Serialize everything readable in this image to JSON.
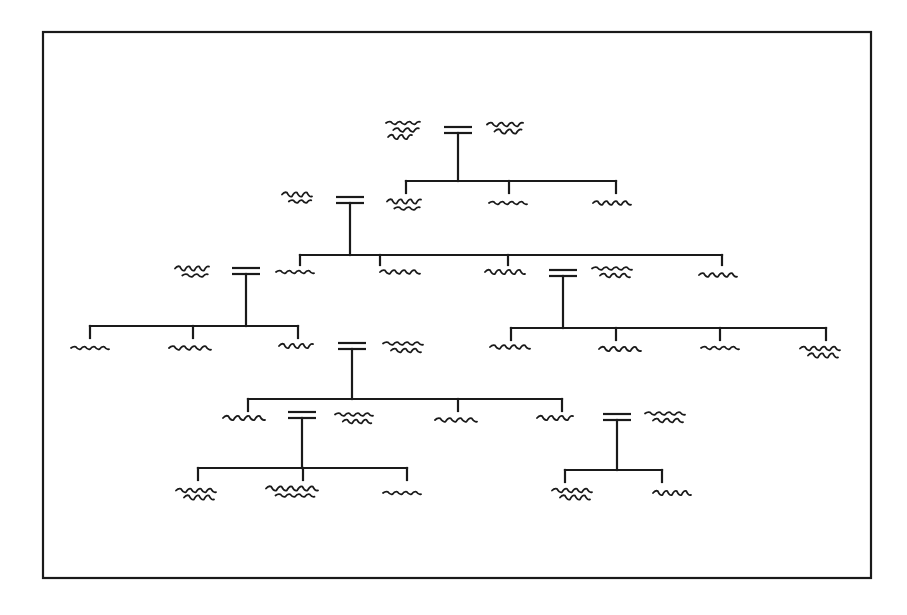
{
  "colors": {
    "ink": "#1a1a1a",
    "background": "#ffffff"
  },
  "frame": {
    "x": 43,
    "y": 32,
    "width": 828,
    "height": 546
  },
  "persons": [
    {
      "id": "p1",
      "label": "illegible name",
      "x": 403,
      "y": 130,
      "w": 34,
      "lines": 3
    },
    {
      "id": "p2",
      "label": "illegible name",
      "x": 505,
      "y": 128,
      "w": 36,
      "lines": 2
    },
    {
      "id": "p3",
      "label": "illegible name",
      "x": 404,
      "y": 205,
      "w": 34,
      "lines": 2
    },
    {
      "id": "p4",
      "label": "illegible name",
      "x": 508,
      "y": 203,
      "w": 38,
      "lines": 1
    },
    {
      "id": "p5",
      "label": "illegible name",
      "x": 612,
      "y": 203,
      "w": 38,
      "lines": 1
    },
    {
      "id": "p6",
      "label": "illegible name",
      "x": 297,
      "y": 198,
      "w": 30,
      "lines": 2
    },
    {
      "id": "p7",
      "label": "illegible name",
      "x": 295,
      "y": 272,
      "w": 38,
      "lines": 1
    },
    {
      "id": "p8",
      "label": "illegible name",
      "x": 400,
      "y": 272,
      "w": 40,
      "lines": 1
    },
    {
      "id": "p9",
      "label": "illegible name",
      "x": 505,
      "y": 272,
      "w": 40,
      "lines": 1
    },
    {
      "id": "p10",
      "label": "illegible name",
      "x": 612,
      "y": 272,
      "w": 40,
      "lines": 2
    },
    {
      "id": "p11",
      "label": "illegible name",
      "x": 718,
      "y": 275,
      "w": 38,
      "lines": 1
    },
    {
      "id": "p12",
      "label": "illegible name",
      "x": 192,
      "y": 272,
      "w": 34,
      "lines": 2
    },
    {
      "id": "p13",
      "label": "illegible name",
      "x": 90,
      "y": 348,
      "w": 38,
      "lines": 1
    },
    {
      "id": "p14",
      "label": "illegible name",
      "x": 190,
      "y": 348,
      "w": 42,
      "lines": 1
    },
    {
      "id": "p15",
      "label": "illegible name",
      "x": 296,
      "y": 346,
      "w": 34,
      "lines": 1
    },
    {
      "id": "p16",
      "label": "illegible name",
      "x": 403,
      "y": 347,
      "w": 40,
      "lines": 2
    },
    {
      "id": "p17",
      "label": "illegible name",
      "x": 510,
      "y": 347,
      "w": 40,
      "lines": 1
    },
    {
      "id": "p18",
      "label": "illegible name",
      "x": 620,
      "y": 349,
      "w": 42,
      "lines": 1
    },
    {
      "id": "p19",
      "label": "illegible name",
      "x": 720,
      "y": 348,
      "w": 38,
      "lines": 1
    },
    {
      "id": "p20",
      "label": "illegible name",
      "x": 820,
      "y": 352,
      "w": 40,
      "lines": 2
    },
    {
      "id": "p21",
      "label": "illegible name",
      "x": 244,
      "y": 418,
      "w": 42,
      "lines": 1
    },
    {
      "id": "p22",
      "label": "illegible name",
      "x": 354,
      "y": 418,
      "w": 38,
      "lines": 2
    },
    {
      "id": "p23",
      "label": "illegible name",
      "x": 456,
      "y": 420,
      "w": 42,
      "lines": 1
    },
    {
      "id": "p24",
      "label": "illegible name",
      "x": 555,
      "y": 418,
      "w": 36,
      "lines": 1
    },
    {
      "id": "p25",
      "label": "illegible name",
      "x": 665,
      "y": 417,
      "w": 40,
      "lines": 2
    },
    {
      "id": "p26",
      "label": "illegible name",
      "x": 196,
      "y": 494,
      "w": 40,
      "lines": 2
    },
    {
      "id": "p27",
      "label": "illegible name",
      "x": 292,
      "y": 492,
      "w": 52,
      "lines": 2
    },
    {
      "id": "p28",
      "label": "illegible name",
      "x": 402,
      "y": 493,
      "w": 38,
      "lines": 1
    },
    {
      "id": "p29",
      "label": "illegible name",
      "x": 572,
      "y": 494,
      "w": 40,
      "lines": 2
    },
    {
      "id": "p30",
      "label": "illegible name",
      "x": 672,
      "y": 493,
      "w": 38,
      "lines": 1
    }
  ],
  "couples": [
    {
      "id": "c1",
      "partners": [
        "p1",
        "p2"
      ],
      "x": 458,
      "y": 130,
      "drop_to": 181,
      "bar_y": 181,
      "children_x": [
        406,
        509,
        616
      ],
      "child_top": 193,
      "children": [
        "p3",
        "p4",
        "p5"
      ]
    },
    {
      "id": "c2",
      "partners": [
        "p6",
        "p3"
      ],
      "x": 350,
      "y": 200,
      "drop_to": 255,
      "bar_y": 255,
      "children_x": [
        300,
        380,
        508,
        722
      ],
      "child_top": 265,
      "children": [
        "p7",
        "p8",
        "p9",
        "p11"
      ]
    },
    {
      "id": "c3",
      "partners": [
        "p12",
        "p7"
      ],
      "x": 246,
      "y": 271,
      "drop_to": 326,
      "bar_y": 326,
      "children_x": [
        90,
        193,
        298
      ],
      "child_top": 338,
      "children": [
        "p13",
        "p14",
        "p15"
      ]
    },
    {
      "id": "c4",
      "partners": [
        "p9",
        "p10"
      ],
      "x": 563,
      "y": 273,
      "drop_to": 328,
      "bar_y": 328,
      "children_x": [
        511,
        616,
        720,
        826
      ],
      "child_top": 340,
      "children": [
        "p17",
        "p18",
        "p19",
        "p20"
      ]
    },
    {
      "id": "c5",
      "partners": [
        "p15",
        "p16"
      ],
      "x": 352,
      "y": 346,
      "drop_to": 399,
      "bar_y": 399,
      "children_x": [
        248,
        458,
        562
      ],
      "child_top": 411,
      "children": [
        "p21",
        "p23",
        "p24"
      ]
    },
    {
      "id": "c6",
      "partners": [
        "p21",
        "p22"
      ],
      "x": 302,
      "y": 415,
      "drop_to": 468,
      "bar_y": 468,
      "children_x": [
        198,
        303,
        407
      ],
      "child_top": 480,
      "children": [
        "p26",
        "p27",
        "p28"
      ]
    },
    {
      "id": "c7",
      "partners": [
        "p24",
        "p25"
      ],
      "x": 617,
      "y": 417,
      "drop_to": 470,
      "bar_y": 470,
      "children_x": [
        565,
        662
      ],
      "child_top": 482,
      "children": [
        "p29",
        "p30"
      ]
    }
  ],
  "legend": {
    "marriage_symbol": "=",
    "marriage_meaning": "married couple",
    "descent_meaning": "line of descent to children"
  }
}
